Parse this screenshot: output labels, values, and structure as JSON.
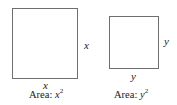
{
  "squares": [
    {
      "name": "large",
      "side_label_right": "x",
      "side_label_bottom": "x",
      "caption_prefix": "Area: ",
      "caption_var": "x",
      "caption_exp": "2"
    },
    {
      "name": "small",
      "side_label_right": "y",
      "side_label_bottom": "y",
      "caption_prefix": "Area: ",
      "caption_var": "y",
      "caption_exp": "2"
    }
  ]
}
